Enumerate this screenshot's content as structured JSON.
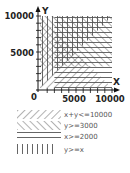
{
  "diagram": {
    "title": "",
    "axes": {
      "x_label": "X",
      "y_label": "Y",
      "origin_label": "0",
      "x_ticks": [
        "5000",
        "10000"
      ],
      "y_ticks": [
        "5000",
        "10000"
      ],
      "range": [
        0,
        10000
      ]
    },
    "regions": [
      {
        "id": "r1",
        "inequality": "x+y<=10000",
        "pattern": "diagonal-forward"
      },
      {
        "id": "r2",
        "inequality": "y>=3000",
        "pattern": "diagonal-backward"
      },
      {
        "id": "r3",
        "inequality": "x>=2000",
        "pattern": "horizontal"
      },
      {
        "id": "r4",
        "inequality": "y>=x",
        "pattern": "vertical"
      }
    ],
    "legend": [
      {
        "label": "x+y<=10000",
        "pattern": "diagonal-forward"
      },
      {
        "label": "y>=3000",
        "pattern": "diagonal-backward"
      },
      {
        "label": "x>=2000",
        "pattern": "horizontal"
      },
      {
        "label": "y>=x",
        "pattern": "vertical"
      }
    ],
    "colors": {
      "axis": "#111111",
      "hatch": "#555555",
      "text": "#222222",
      "legend_text": "#555555"
    }
  }
}
